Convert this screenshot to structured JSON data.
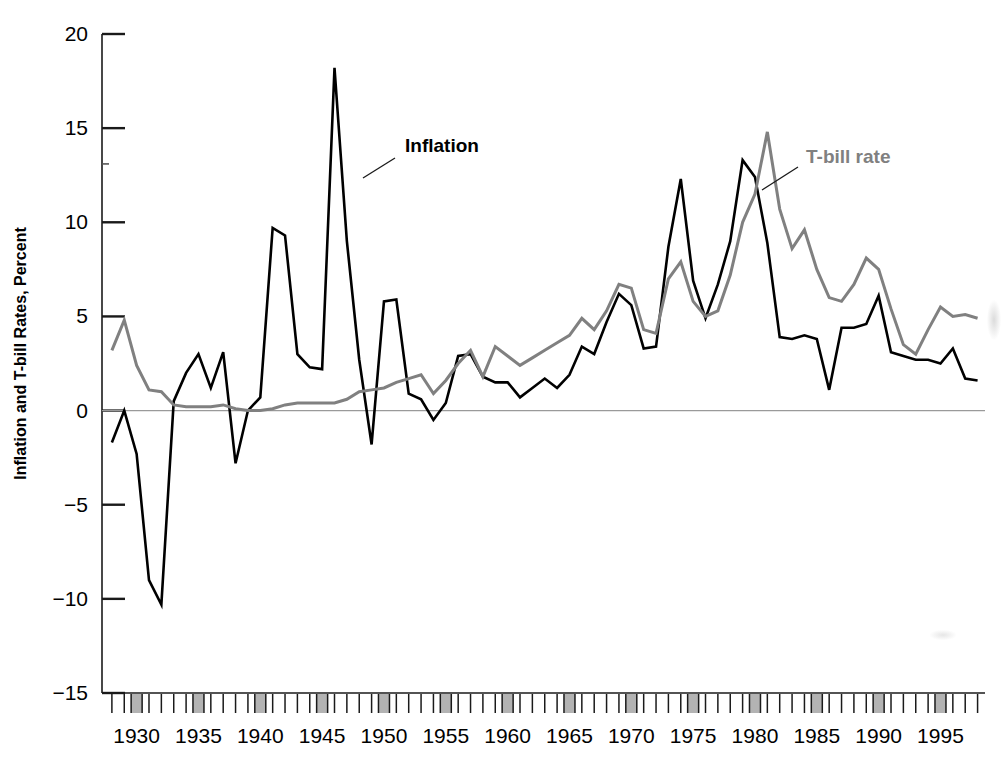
{
  "chart_data": {
    "type": "line",
    "title": "",
    "subtitle": "",
    "xlabel": "",
    "ylabel": "Inflation and T-bill Rates, Percent",
    "xlim": [
      1927.2,
      1998.6
    ],
    "ylim": [
      -15,
      20
    ],
    "yticks": [
      20,
      15,
      10,
      5,
      0,
      -5,
      -10,
      -15
    ],
    "ytick_labels": [
      "20",
      "15",
      "10",
      "5",
      "0",
      "−5",
      "−10",
      "−15"
    ],
    "xticks": [
      1930,
      1935,
      1940,
      1945,
      1950,
      1955,
      1960,
      1965,
      1970,
      1975,
      1980,
      1985,
      1990,
      1995
    ],
    "xtick_labels": [
      "1930",
      "1935",
      "1940",
      "1945",
      "1950",
      "1955",
      "1960",
      "1965",
      "1970",
      "1975",
      "1980",
      "1985",
      "1990",
      "1995"
    ],
    "minor_tick_interval": 1,
    "grid": false,
    "zero_line": true,
    "legend_position": "inline-annotation",
    "x": [
      1928,
      1929,
      1930,
      1931,
      1932,
      1933,
      1934,
      1935,
      1936,
      1937,
      1938,
      1939,
      1940,
      1941,
      1942,
      1943,
      1944,
      1945,
      1946,
      1947,
      1948,
      1949,
      1950,
      1951,
      1952,
      1953,
      1954,
      1955,
      1956,
      1957,
      1958,
      1959,
      1960,
      1961,
      1962,
      1963,
      1964,
      1965,
      1966,
      1967,
      1968,
      1969,
      1970,
      1971,
      1972,
      1973,
      1974,
      1975,
      1976,
      1977,
      1978,
      1979,
      1980,
      1981,
      1982,
      1983,
      1984,
      1985,
      1986,
      1987,
      1988,
      1989,
      1990,
      1991,
      1992,
      1993,
      1994,
      1995,
      1996,
      1997,
      1998
    ],
    "series": [
      {
        "name": "Inflation",
        "color": "#000000",
        "label_color": "#000000",
        "linewidth": 2.6,
        "values": [
          -1.7,
          0.0,
          -2.3,
          -9.0,
          -10.3,
          0.5,
          2.0,
          3.0,
          1.2,
          3.1,
          -2.8,
          0.0,
          0.7,
          9.7,
          9.3,
          3.0,
          2.3,
          2.2,
          18.2,
          9.0,
          2.7,
          -1.8,
          5.8,
          5.9,
          0.9,
          0.6,
          -0.5,
          0.4,
          2.9,
          3.0,
          1.8,
          1.5,
          1.5,
          0.7,
          1.2,
          1.7,
          1.2,
          1.9,
          3.4,
          3.0,
          4.7,
          6.2,
          5.6,
          3.3,
          3.4,
          8.7,
          12.3,
          6.9,
          4.9,
          6.7,
          9.0,
          13.3,
          12.4,
          8.9,
          3.9,
          3.8,
          4.0,
          3.8,
          1.1,
          4.4,
          4.4,
          4.6,
          6.1,
          3.1,
          2.9,
          2.7,
          2.7,
          2.5,
          3.3,
          1.7,
          1.6
        ]
      },
      {
        "name": "T-bill rate",
        "color": "#808080",
        "label_color": "#808080",
        "linewidth": 3.0,
        "values": [
          3.2,
          4.8,
          2.4,
          1.1,
          1.0,
          0.3,
          0.2,
          0.2,
          0.2,
          0.3,
          0.1,
          0.0,
          0.0,
          0.1,
          0.3,
          0.4,
          0.4,
          0.4,
          0.4,
          0.6,
          1.0,
          1.1,
          1.2,
          1.5,
          1.7,
          1.9,
          0.9,
          1.6,
          2.5,
          3.2,
          1.8,
          3.4,
          2.9,
          2.4,
          2.8,
          3.2,
          3.6,
          4.0,
          4.9,
          4.3,
          5.3,
          6.7,
          6.5,
          4.3,
          4.1,
          7.0,
          7.9,
          5.8,
          5.0,
          5.3,
          7.2,
          10.0,
          11.5,
          14.8,
          10.7,
          8.6,
          9.6,
          7.5,
          6.0,
          5.8,
          6.7,
          8.1,
          7.5,
          5.4,
          3.5,
          3.0,
          4.3,
          5.5,
          5.0,
          5.1,
          4.9
        ]
      }
    ],
    "annotations": [
      {
        "name": "inflation-label",
        "text": "Inflation",
        "text_x": 405,
        "text_y": 152,
        "leader_from_x": 395,
        "leader_from_y": 158,
        "leader_to_x": 363,
        "leader_to_y": 178,
        "color": "#000000"
      },
      {
        "name": "tbill-label",
        "text": "T-bill rate",
        "text_x": 806,
        "text_y": 163,
        "leader_from_x": 798,
        "leader_from_y": 167,
        "leader_to_x": 762,
        "leader_to_y": 190,
        "color": "#808080"
      }
    ]
  },
  "axes": {
    "y_axis_title": "Inflation and T-bill Rates, Percent",
    "highlighted_year_ticks": [
      1930,
      1935,
      1940,
      1945,
      1950,
      1955,
      1960,
      1965,
      1970,
      1975,
      1980,
      1985,
      1990,
      1995
    ],
    "highlight_color": "#b3b3b3",
    "axis_color": "#1a1a1a",
    "zero_line_color": "#9a9a9a"
  }
}
